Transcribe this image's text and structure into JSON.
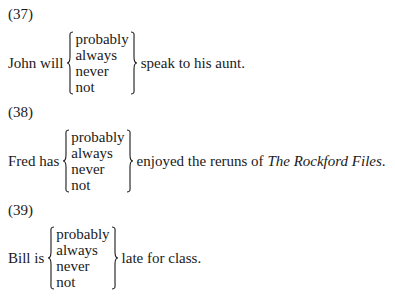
{
  "examples": [
    {
      "number": "(37)",
      "subject": "John will",
      "options": [
        "probably",
        "always",
        "never",
        "not"
      ],
      "predicate": "speak to his aunt."
    },
    {
      "number": "(38)",
      "subject": "Fred has",
      "options": [
        "probably",
        "always",
        "never",
        "not"
      ],
      "predicate_prefix": "enjoyed the reruns of ",
      "predicate_title": "The Rockford Files",
      "predicate_suffix": "."
    },
    {
      "number": "(39)",
      "subject": "Bill is",
      "options": [
        "probably",
        "always",
        "never",
        "not"
      ],
      "predicate": "late for class."
    }
  ]
}
